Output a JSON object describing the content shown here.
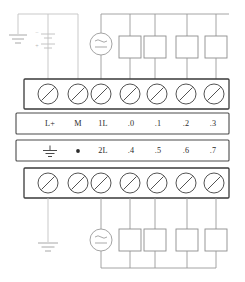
{
  "diagram": {
    "top_header_note": "",
    "bottom_caption": "",
    "terminal_rows": {
      "upper_label_row": {
        "name": "input-terminal-labels",
        "labels": [
          "L+",
          "M",
          "1L",
          ".0",
          ".1",
          ".2",
          ".3"
        ]
      },
      "lower_label_row": {
        "name": "output-terminal-labels",
        "labels": [
          "⏚",
          "•",
          "2L",
          ".4",
          ".5",
          ".6",
          ".7"
        ],
        "first_is_ground_symbol": true,
        "second_is_dot_symbol": true
      }
    },
    "screw_terminals": {
      "upper_count": 7,
      "lower_count": 7,
      "icon": "screw-terminal-icon"
    },
    "sources": {
      "top_dc_supply": {
        "icon": "battery-icon",
        "minus_label": "−",
        "plus_label": "+"
      },
      "top_ac_source": {
        "icon": "ac-dc-source-icon",
        "glyph": "≋"
      },
      "bottom_ac_source": {
        "icon": "ac-dc-source-icon",
        "glyph": "≋"
      }
    },
    "grounds": {
      "top_left": "earth-ground-icon",
      "bottom_left": "earth-ground-icon",
      "label_row_ground": "earth-ground-icon"
    },
    "loads": {
      "top_count": 4,
      "bottom_count": 4,
      "icon": "load-box-icon"
    },
    "colors": {
      "wire": "#9a9a9a",
      "strip_border": "#3a3a3a",
      "label_text": "#2b2b2b",
      "background": "#ffffff"
    }
  }
}
